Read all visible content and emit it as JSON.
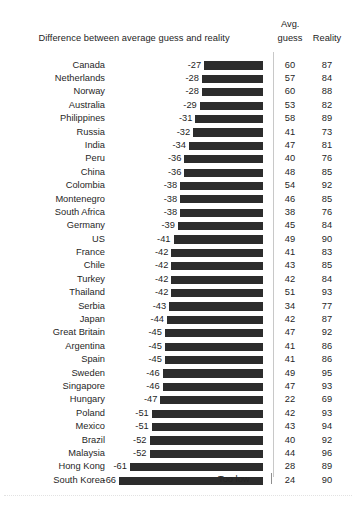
{
  "header": {
    "main_title": "Difference between average guess and reality",
    "avg_label": "Avg.",
    "guess_label": "guess",
    "reality_label": "Reality"
  },
  "footer": {
    "too_low_label": "Too low"
  },
  "colors": {
    "bar": "#2c2c2c",
    "text": "#1f1f1f",
    "divider": "#c8c8c8",
    "background": "#ffffff"
  },
  "chart_data": {
    "type": "bar",
    "title": "Difference between average guess and reality",
    "xlabel": "",
    "ylabel": "",
    "orientation": "horizontal",
    "grid": false,
    "legend": null,
    "annotations": [
      "Too low"
    ],
    "value_axis_note": "Bars are right-aligned at zero and extend left; all values are negative (guesses are too low).",
    "columns": [
      "Country",
      "Difference between average guess and reality",
      "Avg. guess",
      "Reality"
    ],
    "categories": [
      "Canada",
      "Netherlands",
      "Norway",
      "Australia",
      "Philippines",
      "Russia",
      "India",
      "Peru",
      "China",
      "Colombia",
      "Montenegro",
      "South Africa",
      "Germany",
      "US",
      "France",
      "Chile",
      "Turkey",
      "Thailand",
      "Serbia",
      "Japan",
      "Great Britain",
      "Argentina",
      "Spain",
      "Sweden",
      "Singapore",
      "Hungary",
      "Poland",
      "Mexico",
      "Brazil",
      "Malaysia",
      "Hong Kong",
      "South Korea"
    ],
    "values": [
      -27,
      -28,
      -28,
      -29,
      -31,
      -32,
      -34,
      -36,
      -36,
      -38,
      -38,
      -38,
      -39,
      -41,
      -42,
      -42,
      -42,
      -42,
      -43,
      -44,
      -45,
      -45,
      -45,
      -46,
      -46,
      -47,
      -51,
      -51,
      -52,
      -52,
      -61,
      -66
    ],
    "series": [
      {
        "name": "Avg. guess",
        "values": [
          60,
          57,
          60,
          53,
          58,
          41,
          47,
          40,
          48,
          54,
          46,
          38,
          45,
          49,
          41,
          43,
          42,
          51,
          34,
          42,
          47,
          41,
          41,
          49,
          47,
          22,
          42,
          43,
          40,
          44,
          28,
          24
        ]
      },
      {
        "name": "Reality",
        "values": [
          87,
          84,
          88,
          82,
          89,
          73,
          81,
          76,
          85,
          92,
          85,
          76,
          84,
          90,
          83,
          85,
          84,
          93,
          77,
          87,
          92,
          86,
          86,
          95,
          93,
          69,
          93,
          94,
          92,
          96,
          89,
          90
        ]
      }
    ],
    "rows": [
      {
        "country": "Canada",
        "diff": "-27",
        "value": -27,
        "guess": "60",
        "reality": "87"
      },
      {
        "country": "Netherlands",
        "diff": "-28",
        "value": -28,
        "guess": "57",
        "reality": "84"
      },
      {
        "country": "Norway",
        "diff": "-28",
        "value": -28,
        "guess": "60",
        "reality": "88"
      },
      {
        "country": "Australia",
        "diff": "-29",
        "value": -29,
        "guess": "53",
        "reality": "82"
      },
      {
        "country": "Philippines",
        "diff": "-31",
        "value": -31,
        "guess": "58",
        "reality": "89"
      },
      {
        "country": "Russia",
        "diff": "-32",
        "value": -32,
        "guess": "41",
        "reality": "73"
      },
      {
        "country": "India",
        "diff": "-34",
        "value": -34,
        "guess": "47",
        "reality": "81"
      },
      {
        "country": "Peru",
        "diff": "-36",
        "value": -36,
        "guess": "40",
        "reality": "76"
      },
      {
        "country": "China",
        "diff": "-36",
        "value": -36,
        "guess": "48",
        "reality": "85"
      },
      {
        "country": "Colombia",
        "diff": "-38",
        "value": -38,
        "guess": "54",
        "reality": "92"
      },
      {
        "country": "Montenegro",
        "diff": "-38",
        "value": -38,
        "guess": "46",
        "reality": "85"
      },
      {
        "country": "South Africa",
        "diff": "-38",
        "value": -38,
        "guess": "38",
        "reality": "76"
      },
      {
        "country": "Germany",
        "diff": "-39",
        "value": -39,
        "guess": "45",
        "reality": "84"
      },
      {
        "country": "US",
        "diff": "-41",
        "value": -41,
        "guess": "49",
        "reality": "90"
      },
      {
        "country": "France",
        "diff": "-42",
        "value": -42,
        "guess": "41",
        "reality": "83"
      },
      {
        "country": "Chile",
        "diff": "-42",
        "value": -42,
        "guess": "43",
        "reality": "85"
      },
      {
        "country": "Turkey",
        "diff": "-42",
        "value": -42,
        "guess": "42",
        "reality": "84"
      },
      {
        "country": "Thailand",
        "diff": "-42",
        "value": -42,
        "guess": "51",
        "reality": "93"
      },
      {
        "country": "Serbia",
        "diff": "-43",
        "value": -43,
        "guess": "34",
        "reality": "77"
      },
      {
        "country": "Japan",
        "diff": "-44",
        "value": -44,
        "guess": "42",
        "reality": "87"
      },
      {
        "country": "Great Britain",
        "diff": "-45",
        "value": -45,
        "guess": "47",
        "reality": "92"
      },
      {
        "country": "Argentina",
        "diff": "-45",
        "value": -45,
        "guess": "41",
        "reality": "86"
      },
      {
        "country": "Spain",
        "diff": "-45",
        "value": -45,
        "guess": "41",
        "reality": "86"
      },
      {
        "country": "Sweden",
        "diff": "-46",
        "value": -46,
        "guess": "49",
        "reality": "95"
      },
      {
        "country": "Singapore",
        "diff": "-46",
        "value": -46,
        "guess": "47",
        "reality": "93"
      },
      {
        "country": "Hungary",
        "diff": "-47",
        "value": -47,
        "guess": "22",
        "reality": "69"
      },
      {
        "country": "Poland",
        "diff": "-51",
        "value": -51,
        "guess": "42",
        "reality": "93"
      },
      {
        "country": "Mexico",
        "diff": "-51",
        "value": -51,
        "guess": "43",
        "reality": "94"
      },
      {
        "country": "Brazil",
        "diff": "-52",
        "value": -52,
        "guess": "40",
        "reality": "92"
      },
      {
        "country": "Malaysia",
        "diff": "-52",
        "value": -52,
        "guess": "44",
        "reality": "96"
      },
      {
        "country": "Hong Kong",
        "diff": "-61",
        "value": -61,
        "guess": "28",
        "reality": "89"
      },
      {
        "country": "South Korea",
        "diff": "-66",
        "value": -66,
        "guess": "24",
        "reality": "90"
      }
    ]
  }
}
